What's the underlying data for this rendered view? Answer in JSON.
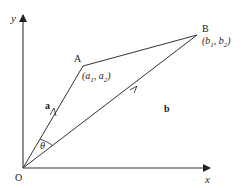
{
  "diagram": {
    "axes": {
      "x_label": "x",
      "y_label": "y",
      "origin_label": "O"
    },
    "points": {
      "A": {
        "label": "A",
        "coords": "(a1, a2)",
        "coord_parts": [
          "a",
          "1",
          "a",
          "2"
        ]
      },
      "B": {
        "label": "B",
        "coords": "(b1, b2)",
        "coord_parts": [
          "b",
          "1",
          "b",
          "2"
        ]
      }
    },
    "vectors": {
      "a": "a",
      "b": "b"
    },
    "angle": "θ",
    "stroke_color": "#333333"
  }
}
